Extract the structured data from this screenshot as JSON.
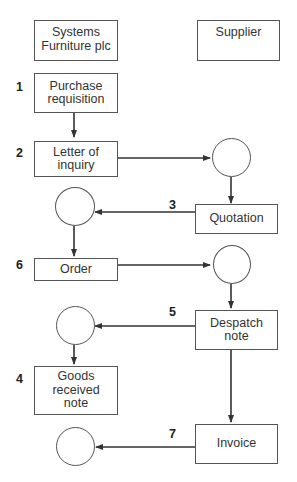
{
  "headers": {
    "left": "Systems\nFurniture plc",
    "right": "Supplier"
  },
  "boxes": {
    "purchase_requisition": "Purchase\nrequisition",
    "letter_of_inquiry": "Letter of\ninquiry",
    "quotation": "Quotation",
    "order": "Order",
    "despatch_note": "Despatch\nnote",
    "goods_received_note": "Goods\nreceived\nnote",
    "invoice": "Invoice"
  },
  "step_numbers": {
    "purchase_requisition": "1",
    "letter_of_inquiry": "2",
    "quotation": "3",
    "despatch_note": "5",
    "order": "6",
    "goods_received_note": "4",
    "invoice": "7"
  },
  "colors": {
    "line": "#333333",
    "border": "#555555",
    "background": "#ffffff"
  }
}
